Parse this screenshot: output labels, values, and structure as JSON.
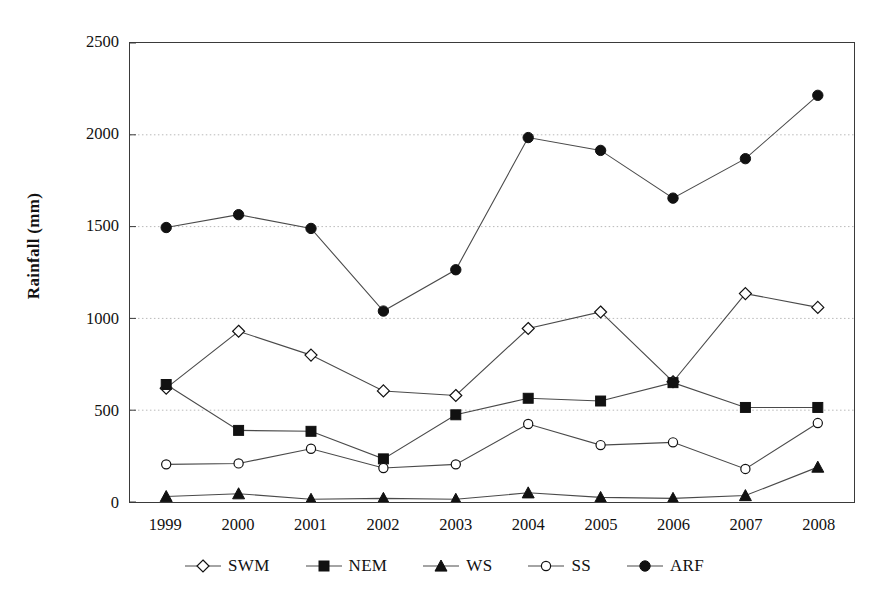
{
  "chart_data": {
    "type": "line",
    "title": "",
    "xlabel": "",
    "ylabel": "Rainfall (mm)",
    "categories": [
      "1999",
      "2000",
      "2001",
      "2002",
      "2003",
      "2004",
      "2005",
      "2006",
      "2007",
      "2008"
    ],
    "ylim": [
      0,
      2500
    ],
    "yticks": [
      0,
      500,
      1000,
      1500,
      2000,
      2500
    ],
    "grid": "horizontal dotted gridlines at 500, 1000, 1500, 2000",
    "legend_position": "bottom-center",
    "series": [
      {
        "name": "SWM",
        "marker": "open-diamond",
        "values": [
          620,
          930,
          800,
          605,
          580,
          945,
          1035,
          655,
          1135,
          1060
        ]
      },
      {
        "name": "NEM",
        "marker": "filled-square",
        "values": [
          640,
          390,
          385,
          235,
          475,
          565,
          550,
          650,
          515,
          515
        ]
      },
      {
        "name": "WS",
        "marker": "filled-triangle",
        "values": [
          30,
          45,
          15,
          20,
          15,
          50,
          25,
          20,
          35,
          190
        ]
      },
      {
        "name": "SS",
        "marker": "open-circle",
        "values": [
          205,
          210,
          290,
          185,
          205,
          425,
          310,
          325,
          180,
          430
        ]
      },
      {
        "name": "ARF",
        "marker": "filled-circle",
        "values": [
          1495,
          1565,
          1490,
          1040,
          1265,
          1985,
          1915,
          1655,
          1870,
          2215
        ]
      }
    ]
  },
  "legend": {
    "items": [
      {
        "label": "SWM",
        "marker": "open-diamond-icon"
      },
      {
        "label": "NEM",
        "marker": "filled-square-icon"
      },
      {
        "label": "WS",
        "marker": "filled-triangle-icon"
      },
      {
        "label": "SS",
        "marker": "open-circle-icon"
      },
      {
        "label": "ARF",
        "marker": "filled-circle-icon"
      }
    ]
  },
  "colors": {
    "line": "#4a4a4a",
    "marker": "#111111",
    "axis": "#3a3a3a",
    "grid": "#b9b9b9",
    "text": "#111111",
    "background": "#ffffff"
  }
}
